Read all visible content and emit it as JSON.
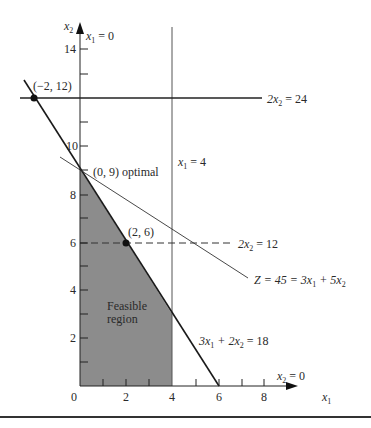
{
  "figure": {
    "axes": {
      "x_label": "x",
      "x_label_sub": "1",
      "y_label": "x",
      "y_label_sub": "2",
      "x_ticks": [
        "0",
        "2",
        "4",
        "6",
        "8"
      ],
      "y_ticks": [
        "2",
        "4",
        "6",
        "8",
        "10",
        "14"
      ]
    },
    "constraints": {
      "x1_eq_0": {
        "pre": "x",
        "sub": "1",
        "post": " = 0"
      },
      "x1_eq_4": {
        "pre": "x",
        "sub": "1",
        "post": " = 4"
      },
      "x2_eq_0": {
        "pre": "x",
        "sub": "2",
        "post": " = 0"
      },
      "two_x2_eq_24": {
        "pre": "2x",
        "sub": "2",
        "post": " = 24"
      },
      "two_x2_eq_12": {
        "pre": "2x",
        "sub": "2",
        "post": " = 12"
      },
      "three_x1_plus_two_x2": {
        "a": "3x",
        "a_sub": "1",
        "mid": " + 2x",
        "b_sub": "2",
        "post": " = 18"
      }
    },
    "objective": {
      "pre": "Z = 45 = 3x",
      "a_sub": "1",
      "mid": " + 5x",
      "b_sub": "2"
    },
    "points": {
      "p1": "(−2, 12)",
      "p2": "(0, 9) optimal",
      "p3": "(2, 6)"
    },
    "region": {
      "line1": "Feasible",
      "line2": "region"
    },
    "colors": {
      "feasible_fill": "#8c8c8c",
      "line": "#222222",
      "background": "#ffffff"
    }
  }
}
